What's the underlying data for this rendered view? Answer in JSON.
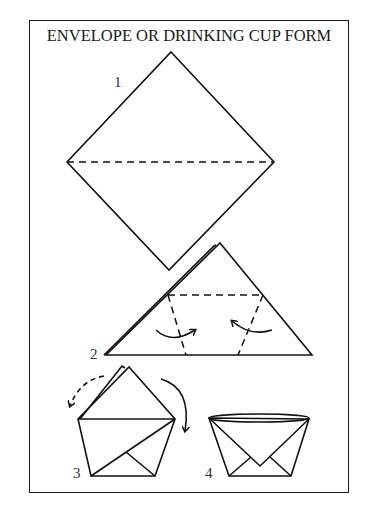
{
  "title": "ENVELOPE OR DRINKING CUP FORM",
  "steps": [
    {
      "number": "1",
      "description": "square diamond with horizontal dashed fold line"
    },
    {
      "number": "2",
      "description": "folded triangle with dashed fold lines and curved fold arrows"
    },
    {
      "number": "3",
      "description": "pentagon shape with corners folded, flap fold arrows"
    },
    {
      "number": "4",
      "description": "finished cup with open rim"
    }
  ],
  "colors": {
    "line": "#111111",
    "background": "#ffffff"
  }
}
